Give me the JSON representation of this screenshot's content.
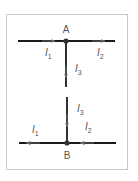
{
  "diagram": {
    "type": "circuit-junctions",
    "colors": {
      "wire": "#1a1a1a",
      "arrow": "#666666",
      "border": "#c8c8c8",
      "text": "#555555"
    },
    "junction_a": {
      "label": "A",
      "currents": [
        {
          "name": "I",
          "sub": "1",
          "direction": "into junction (left to right)"
        },
        {
          "name": "I",
          "sub": "2",
          "direction": "out of junction (to right)"
        },
        {
          "name": "I",
          "sub": "3",
          "direction": "out of junction (downward)"
        }
      ]
    },
    "junction_b": {
      "label": "B",
      "currents": [
        {
          "name": "I",
          "sub": "3",
          "direction": "into junction (downward)"
        },
        {
          "name": "I",
          "sub": "2",
          "direction": "into junction (right to left)"
        },
        {
          "name": "I",
          "sub": "1",
          "direction": "out of junction (to left)"
        }
      ]
    }
  }
}
